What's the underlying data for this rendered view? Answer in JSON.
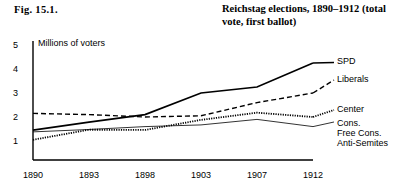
{
  "figure": {
    "number": "Fig. 15.1.",
    "title": "Reichstag elections, 1890–1912 (total vote, first ballot)"
  },
  "chart_data": {
    "type": "line",
    "title": "Reichstag elections, 1890–1912 (total vote, first ballot)",
    "xlabel": "",
    "ylabel": "Millions of voters",
    "categories": [
      "1890",
      "1893",
      "1898",
      "1903",
      "1907",
      "1912"
    ],
    "x": [
      1890,
      1893,
      1898,
      1903,
      1907,
      1912
    ],
    "ylim": [
      0,
      5
    ],
    "yticks": [
      1,
      2,
      3,
      4,
      5
    ],
    "grid": false,
    "legend_position": "right-of-plot-inline",
    "series": [
      {
        "name": "SPD",
        "style": "solid-thick",
        "values": [
          1.45,
          1.79,
          2.1,
          3.0,
          3.25,
          4.25
        ]
      },
      {
        "name": "Liberals",
        "style": "dashed",
        "values": [
          2.15,
          2.1,
          2.0,
          2.05,
          2.6,
          3.0
        ]
      },
      {
        "name": "Center",
        "style": "dotted",
        "values": [
          1.05,
          1.47,
          1.46,
          1.88,
          2.18,
          2.0
        ]
      },
      {
        "name": "Cons. Free Cons. Anti-Semites",
        "style": "solid-thin",
        "values": [
          1.38,
          1.48,
          1.6,
          1.67,
          1.9,
          1.6
        ]
      }
    ]
  },
  "axes": {
    "y_axis_label": "Millions of voters",
    "y_ticks": [
      "5",
      "4",
      "3",
      "2",
      "1"
    ],
    "x_ticks": [
      "1890",
      "1893",
      "1898",
      "1903",
      "1907",
      "1912"
    ]
  },
  "legend": {
    "spd": "SPD",
    "liberals": "Liberals",
    "center": "Center",
    "cons": "Cons.",
    "free_cons": "Free Cons.",
    "anti_semites": "Anti-Semites"
  },
  "colors": {
    "ink": "#000000",
    "background": "#ffffff"
  }
}
